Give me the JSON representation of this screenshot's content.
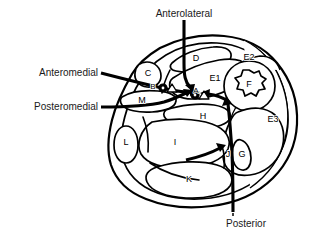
{
  "figure": {
    "background_color": "#ffffff",
    "line_color": "#000000"
  },
  "callouts": [
    {
      "id": "anterolateral",
      "label": "Anterolateral",
      "position": "top-center",
      "text_x": 184,
      "text_y": 14,
      "anchor": "mid"
    },
    {
      "id": "anteromedial",
      "label": "Anteromedial",
      "position": "left-upper",
      "text_x": 98,
      "text_y": 73,
      "anchor": "end"
    },
    {
      "id": "posteromedial",
      "label": "Posteromedial",
      "position": "left-lower",
      "text_x": 98,
      "text_y": 107,
      "anchor": "end"
    },
    {
      "id": "posterior",
      "label": "Posterior",
      "position": "bottom-center",
      "text_x": 246,
      "text_y": 224,
      "anchor": "mid"
    }
  ],
  "region_labels": [
    {
      "id": "region-a",
      "label": "A",
      "x": 196,
      "y": 91,
      "size": "small"
    },
    {
      "id": "region-b",
      "label": "B",
      "x": 153,
      "y": 87,
      "size": "small"
    },
    {
      "id": "region-c",
      "label": "C",
      "x": 148,
      "y": 74,
      "size": "normal"
    },
    {
      "id": "region-d",
      "label": "D",
      "x": 196,
      "y": 59,
      "size": "normal"
    },
    {
      "id": "region-e1",
      "label": "E1",
      "x": 215,
      "y": 79,
      "size": "normal"
    },
    {
      "id": "region-e2",
      "label": "E2",
      "x": 249,
      "y": 58,
      "size": "normal"
    },
    {
      "id": "region-e3",
      "label": "E3",
      "x": 273,
      "y": 120,
      "size": "normal"
    },
    {
      "id": "region-f",
      "label": "F",
      "x": 249,
      "y": 85,
      "size": "normal"
    },
    {
      "id": "region-g",
      "label": "G",
      "x": 242,
      "y": 155,
      "size": "normal"
    },
    {
      "id": "region-h",
      "label": "H",
      "x": 203,
      "y": 117,
      "size": "normal"
    },
    {
      "id": "region-i",
      "label": "I",
      "x": 175,
      "y": 143,
      "size": "normal"
    },
    {
      "id": "region-j",
      "label": "J",
      "x": 228,
      "y": 155,
      "size": "normal"
    },
    {
      "id": "region-k",
      "label": "K",
      "x": 189,
      "y": 180,
      "size": "normal"
    },
    {
      "id": "region-l",
      "label": "L",
      "x": 126,
      "y": 143,
      "size": "normal"
    },
    {
      "id": "region-m",
      "label": "M",
      "x": 142,
      "y": 101,
      "size": "normal"
    }
  ]
}
